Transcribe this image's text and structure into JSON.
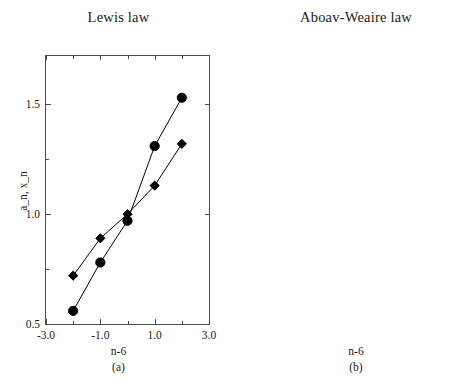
{
  "figure": {
    "width": 475,
    "height": 382,
    "background": "#ffffff",
    "ink_color": "#1a1a1a",
    "axis_color": "#4a4a4a"
  },
  "panels": [
    {
      "id": "a",
      "caption": "(a)",
      "title": "Lewis law",
      "xlabel": "n-6",
      "ylabel": "a_n, x_n",
      "x_ticks": [
        "-3.0",
        "-1.0",
        "1.0",
        "3.0"
      ],
      "x_tick_values": [
        -3,
        -1,
        1,
        3
      ],
      "y_ticks": [
        "0.5",
        "1.0",
        "1.5"
      ],
      "y_tick_values": [
        0.5,
        1.0,
        1.5
      ],
      "xlim": [
        -3.0,
        3.0
      ],
      "ylim": [
        0.5,
        1.72
      ]
    },
    {
      "id": "b",
      "caption": "(b)",
      "title": "Aboav-Weaire law",
      "xlabel": "n-6",
      "ylabel": "n*m",
      "x_ticks": [
        "-3.0",
        "-1.0",
        "1.0",
        "3.0"
      ],
      "x_tick_values": [
        -3,
        -1,
        1,
        3
      ],
      "y_ticks": [
        "25.0",
        "30.0",
        "35.0",
        "40.0",
        "45.0",
        "50.0"
      ],
      "y_tick_values": [
        25.0,
        30.0,
        35.0,
        40.0,
        45.0,
        50.0
      ],
      "xlim": [
        -3.0,
        3.0
      ],
      "ylim": [
        25.0,
        50.0
      ]
    }
  ],
  "chart_data": [
    {
      "type": "scatter",
      "panel": "a",
      "title": "Lewis law",
      "xlabel": "n-6",
      "ylabel": "a_n, x_n",
      "xlim": [
        -3.0,
        3.0
      ],
      "ylim": [
        0.5,
        1.72
      ],
      "grid": false,
      "legend": "none",
      "x": [
        -2,
        -1,
        0,
        1,
        2
      ],
      "series": [
        {
          "name": "a_n",
          "marker": "circle",
          "color": "#000000",
          "line": true,
          "values": [
            0.56,
            0.78,
            0.97,
            1.31,
            1.53
          ]
        },
        {
          "name": "x_n",
          "marker": "diamond",
          "color": "#000000",
          "line": true,
          "values": [
            0.72,
            0.89,
            1.0,
            1.13,
            1.32
          ]
        }
      ]
    },
    {
      "type": "scatter",
      "panel": "b",
      "title": "Aboav-Weaire law",
      "xlabel": "n-6",
      "ylabel": "n*m",
      "xlim": [
        -3.0,
        3.0
      ],
      "ylim": [
        25.0,
        50.0
      ],
      "grid": false,
      "legend": "none",
      "x": [
        -2,
        -1,
        0,
        1,
        2
      ],
      "series": [
        {
          "name": "n*m",
          "marker": "square",
          "color": "#000000",
          "line": true,
          "values": [
            26.2,
            31.5,
            36.4,
            40.9,
            46.0
          ]
        }
      ]
    }
  ]
}
